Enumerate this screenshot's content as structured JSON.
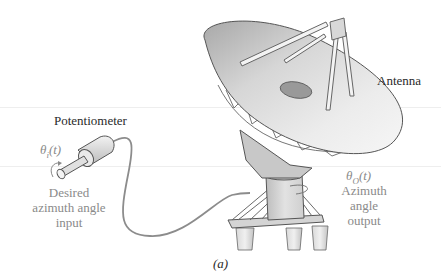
{
  "figure": {
    "caption": "(a)",
    "labels": {
      "antenna": "Antenna",
      "potentiometer": "Potentiometer",
      "input_symbol": "θi(t)",
      "input_symbol_base": "θ",
      "input_symbol_sub": "i",
      "input_symbol_arg": "(t)",
      "input_desc": [
        "Desired",
        "azimuth angle",
        "input"
      ],
      "output_symbol_base": "θ",
      "output_symbol_sub": "O",
      "output_symbol_arg": "(t)",
      "output_desc": [
        "Azimuth",
        "angle",
        "output"
      ]
    },
    "components": [
      "dish-antenna",
      "feed-tripod",
      "pedestal",
      "base-frame",
      "support-legs",
      "potentiometer",
      "cable"
    ]
  },
  "colors": {
    "background": "#ffffff",
    "dish_light": "#e6e6e6",
    "dish_dark": "#9a9a9a",
    "outline": "#555555",
    "text": "#2a2a2a",
    "faint_text": "#8a8a8a"
  }
}
